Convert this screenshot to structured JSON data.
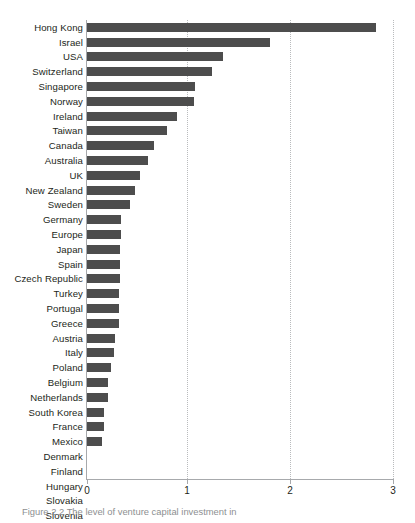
{
  "chart_data": {
    "type": "bar",
    "orientation": "horizontal",
    "title": "",
    "xlabel": "",
    "ylabel": "",
    "xlim": [
      0,
      3
    ],
    "xticks": [
      "0",
      "1",
      "2",
      "3"
    ],
    "grid": true,
    "legend": false,
    "bar_color": "#4d4d4d",
    "axis_color": "#a7a9ac",
    "gridline_color": "#b9bbbd",
    "categories": [
      "Hong Kong",
      "Israel",
      "USA",
      "Switzerland",
      "Singapore",
      "Norway",
      "Ireland",
      "Taiwan",
      "Canada",
      "Australia",
      "UK",
      "New Zealand",
      "Sweden",
      "Germany",
      "Europe",
      "Japan",
      "Spain",
      "Czech Republic",
      "Turkey",
      "Portugal",
      "Greece",
      "Austria",
      "Italy",
      "Poland",
      "Belgium",
      "Netherlands",
      "South Korea",
      "France",
      "Mexico",
      "Denmark",
      "Finland",
      "Hungary",
      "Slovakia",
      "Slovenia"
    ],
    "values": [
      2.83,
      1.79,
      1.33,
      1.23,
      1.06,
      1.05,
      0.88,
      0.78,
      0.66,
      0.6,
      0.52,
      0.47,
      0.42,
      0.33,
      0.33,
      0.32,
      0.32,
      0.32,
      0.31,
      0.31,
      0.31,
      0.27,
      0.26,
      0.24,
      0.21,
      0.21,
      0.17,
      0.17,
      0.15,
      0,
      0,
      0,
      0,
      0
    ]
  },
  "caption": {
    "text": "Figure 2.2 The level of venture capital investment in"
  }
}
